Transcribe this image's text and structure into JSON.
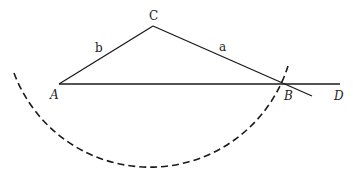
{
  "diagram": {
    "points": {
      "A": {
        "label": "A",
        "x": 59,
        "y": 84
      },
      "B": {
        "label": "B",
        "x": 285,
        "y": 84
      },
      "C": {
        "label": "C",
        "x": 153,
        "y": 26
      },
      "D": {
        "label": "D",
        "x": 340,
        "y": 84
      }
    },
    "sides": {
      "a": {
        "label": "a"
      },
      "b": {
        "label": "b"
      }
    },
    "arc": {
      "center": "C",
      "radius": "a",
      "style": "dashed"
    },
    "colors": {
      "stroke": "#1a1a1a"
    }
  }
}
